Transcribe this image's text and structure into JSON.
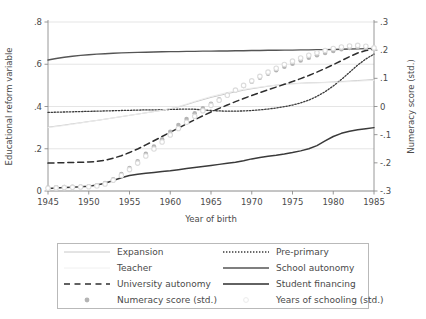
{
  "chart_data": {
    "type": "line",
    "title": "",
    "xlabel": "Year of birth",
    "ylabel": "Educational reform variable",
    "ylabel_right": "Numeracy score (std.)",
    "xlim": [
      1945,
      1985
    ],
    "ylim": [
      0,
      0.8
    ],
    "ylim_right": [
      -0.3,
      0.3
    ],
    "xticks": [
      "1945",
      "1950",
      "1955",
      "1960",
      "1965",
      "1970",
      "1975",
      "1980",
      "1985"
    ],
    "xtick_values": [
      1945,
      1950,
      1955,
      1960,
      1965,
      1970,
      1975,
      1980,
      1985
    ],
    "yticks": [
      "0",
      ".2",
      ".4",
      ".6",
      ".8"
    ],
    "ytick_values": [
      0,
      0.2,
      0.4,
      0.6,
      0.8
    ],
    "yticks_right": [
      ".3",
      ".2",
      ".1",
      "0",
      "-.1",
      "-.2",
      "-.3"
    ],
    "ytick_values_right": [
      0.3,
      0.2,
      0.1,
      0,
      -0.1,
      -0.2,
      -0.3
    ],
    "grid": true,
    "legend_position": "below-plot",
    "x": [
      1945,
      1946,
      1947,
      1948,
      1949,
      1950,
      1951,
      1952,
      1953,
      1954,
      1955,
      1956,
      1957,
      1958,
      1959,
      1960,
      1961,
      1962,
      1963,
      1964,
      1965,
      1966,
      1967,
      1968,
      1969,
      1970,
      1971,
      1972,
      1973,
      1974,
      1975,
      1976,
      1977,
      1978,
      1979,
      1980,
      1981,
      1982,
      1983,
      1984,
      1985
    ],
    "series": [
      {
        "name": "Expansion",
        "axis": "left",
        "style": "solid",
        "color": "#c8c8c8",
        "width": 1.0,
        "values": [
          0.302,
          0.307,
          0.312,
          0.318,
          0.323,
          0.329,
          0.334,
          0.34,
          0.346,
          0.352,
          0.358,
          0.364,
          0.37,
          0.376,
          0.382,
          0.389,
          0.398,
          0.409,
          0.421,
          0.432,
          0.443,
          0.452,
          0.461,
          0.469,
          0.477,
          0.484,
          0.49,
          0.496,
          0.501,
          0.505,
          0.508,
          0.51,
          0.512,
          0.513,
          0.514,
          0.516,
          0.518,
          0.52,
          0.523,
          0.525,
          0.528
        ]
      },
      {
        "name": "Pre-primary",
        "axis": "left",
        "style": "dotted",
        "color": "#3a3a3a",
        "width": 1.3,
        "values": [
          0.372,
          0.373,
          0.374,
          0.375,
          0.376,
          0.377,
          0.378,
          0.379,
          0.38,
          0.381,
          0.382,
          0.383,
          0.384,
          0.384,
          0.385,
          0.386,
          0.387,
          0.388,
          0.387,
          0.384,
          0.381,
          0.379,
          0.378,
          0.378,
          0.379,
          0.381,
          0.384,
          0.388,
          0.393,
          0.399,
          0.407,
          0.417,
          0.43,
          0.448,
          0.47,
          0.497,
          0.528,
          0.562,
          0.596,
          0.625,
          0.648
        ]
      },
      {
        "name": "Teacher",
        "axis": "left",
        "style": "solid",
        "color": "#ececec",
        "width": 1.0,
        "values": [
          0.3,
          0.305,
          0.31,
          0.316,
          0.322,
          0.328,
          0.334,
          0.34,
          0.346,
          0.352,
          0.358,
          0.364,
          0.37,
          0.376,
          0.383,
          0.39,
          0.4,
          0.412,
          0.424,
          0.436,
          0.447,
          0.457,
          0.466,
          0.474,
          0.481,
          0.487,
          0.492,
          0.497,
          0.501,
          0.504,
          0.507,
          0.509,
          0.511,
          0.512,
          0.513,
          0.514,
          0.516,
          0.518,
          0.52,
          0.522,
          0.524
        ]
      },
      {
        "name": "School autonomy",
        "axis": "left",
        "style": "solid",
        "color": "#555555",
        "width": 1.4,
        "values": [
          0.62,
          0.627,
          0.633,
          0.638,
          0.642,
          0.645,
          0.648,
          0.65,
          0.652,
          0.654,
          0.655,
          0.656,
          0.657,
          0.658,
          0.659,
          0.66,
          0.66,
          0.661,
          0.661,
          0.662,
          0.662,
          0.663,
          0.663,
          0.664,
          0.664,
          0.665,
          0.665,
          0.666,
          0.666,
          0.667,
          0.667,
          0.668,
          0.668,
          0.669,
          0.669,
          0.67,
          0.671,
          0.672,
          0.673,
          0.674,
          0.675
        ]
      },
      {
        "name": "University autonomy",
        "axis": "left",
        "style": "dashed",
        "color": "#2e2e2e",
        "width": 1.5,
        "values": [
          0.132,
          0.133,
          0.134,
          0.135,
          0.136,
          0.137,
          0.14,
          0.146,
          0.155,
          0.167,
          0.182,
          0.199,
          0.218,
          0.238,
          0.258,
          0.278,
          0.298,
          0.318,
          0.337,
          0.356,
          0.374,
          0.391,
          0.407,
          0.423,
          0.438,
          0.452,
          0.466,
          0.479,
          0.492,
          0.505,
          0.518,
          0.532,
          0.547,
          0.563,
          0.58,
          0.598,
          0.617,
          0.636,
          0.653,
          0.665,
          0.672
        ]
      },
      {
        "name": "Student financing",
        "axis": "left",
        "style": "solid",
        "color": "#3a3a3a",
        "width": 1.5,
        "values": [
          0.012,
          0.014,
          0.016,
          0.018,
          0.02,
          0.023,
          0.028,
          0.037,
          0.05,
          0.063,
          0.073,
          0.079,
          0.084,
          0.088,
          0.092,
          0.096,
          0.101,
          0.106,
          0.111,
          0.116,
          0.121,
          0.126,
          0.131,
          0.136,
          0.143,
          0.152,
          0.159,
          0.164,
          0.169,
          0.175,
          0.182,
          0.19,
          0.2,
          0.215,
          0.237,
          0.258,
          0.273,
          0.283,
          0.29,
          0.295,
          0.3
        ]
      },
      {
        "name": "Numeracy score (std.)",
        "axis": "right",
        "style": "markers",
        "marker": "circle-filled",
        "color": "#b4b4b4",
        "size": 4.5,
        "values": [
          -0.288,
          -0.287,
          -0.286,
          -0.285,
          -0.284,
          -0.283,
          -0.28,
          -0.272,
          -0.258,
          -0.24,
          -0.218,
          -0.194,
          -0.168,
          -0.142,
          -0.116,
          -0.09,
          -0.066,
          -0.044,
          -0.024,
          -0.006,
          0.01,
          0.026,
          0.042,
          0.058,
          0.073,
          0.088,
          0.102,
          0.116,
          0.129,
          0.141,
          0.152,
          0.163,
          0.173,
          0.182,
          0.19,
          0.197,
          0.203,
          0.208,
          0.211,
          0.209,
          0.204
        ]
      },
      {
        "name": "Years of schooling (std.)",
        "axis": "right",
        "style": "markers",
        "marker": "circle-open",
        "color": "#dcdcdc",
        "size": 4.5,
        "values": [
          -0.29,
          -0.289,
          -0.288,
          -0.287,
          -0.286,
          -0.285,
          -0.282,
          -0.275,
          -0.262,
          -0.245,
          -0.224,
          -0.201,
          -0.176,
          -0.151,
          -0.126,
          -0.101,
          -0.078,
          -0.056,
          -0.035,
          -0.015,
          0.004,
          0.022,
          0.04,
          0.058,
          0.075,
          0.091,
          0.107,
          0.122,
          0.136,
          0.149,
          0.161,
          0.172,
          0.182,
          0.191,
          0.199,
          0.206,
          0.211,
          0.215,
          0.217,
          0.214,
          0.208
        ]
      }
    ]
  },
  "legend": {
    "rows": [
      {
        "left": {
          "label": "Expansion",
          "key": "line-light-solid"
        },
        "right": {
          "label": "Pre-primary",
          "key": "line-dotted"
        }
      },
      {
        "left": {
          "label": "Teacher",
          "key": "line-faint-solid"
        },
        "right": {
          "label": "School autonomy",
          "key": "line-medium-solid"
        }
      },
      {
        "left": {
          "label": "University autonomy",
          "key": "line-dashed"
        },
        "right": {
          "label": "Student financing",
          "key": "line-dark-solid"
        }
      },
      {
        "left": {
          "label": "Numeracy score (std.)",
          "key": "marker-filled"
        },
        "right": {
          "label": "Years of schooling (std.)",
          "key": "marker-open"
        }
      }
    ]
  },
  "colors": {
    "axis": "#8c8c8c",
    "grid": "#e2e2e2",
    "text": "#4a4a4a",
    "legend_border": "#b9b9b9"
  }
}
